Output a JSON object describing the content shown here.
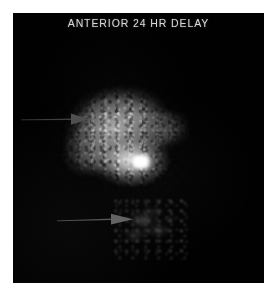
{
  "viewer": {
    "name": "nuclear-medicine-scan-viewer",
    "background_color": "#ffffff",
    "image_background_color": "#010101"
  },
  "study": {
    "label": "ANTERIOR 24 HR DELAY",
    "view": "ANTERIOR",
    "delay": "24 HR DELAY",
    "modality": "scintigraphy",
    "label_color": "#d8d8d8"
  },
  "image": {
    "frame": {
      "x": 13,
      "y": 13,
      "width": 251,
      "height": 270
    },
    "findings": [
      {
        "name": "primary-uptake",
        "description": "Large mottled region of intense radiotracer uptake",
        "bounds": {
          "x": 57,
          "y": 81,
          "width": 132,
          "height": 120
        },
        "intensity": "high"
      },
      {
        "name": "focal-hotspot",
        "description": "Discrete intense focal hot spot",
        "center": {
          "x": 128,
          "y": 150
        },
        "intensity": "maximum",
        "color": "#ffffff"
      },
      {
        "name": "secondary-uptake",
        "description": "Faint diffuse activity inferior to main uptake",
        "bounds": {
          "x": 113,
          "y": 198,
          "width": 78,
          "height": 62
        },
        "intensity": "faint"
      }
    ]
  },
  "annotations": {
    "arrows": [
      {
        "name": "arrow-primary",
        "label": "upper-arrow",
        "points_to": "primary-uptake",
        "direction": "right",
        "color": "#4a4a4a",
        "tail": {
          "x": 22,
          "y": 117
        },
        "head": {
          "x": 76,
          "y": 117
        }
      },
      {
        "name": "arrow-secondary",
        "label": "lower-arrow",
        "points_to": "secondary-uptake",
        "direction": "right",
        "color": "#606060",
        "tail": {
          "x": 58,
          "y": 217
        },
        "head": {
          "x": 118,
          "y": 217
        }
      }
    ]
  }
}
